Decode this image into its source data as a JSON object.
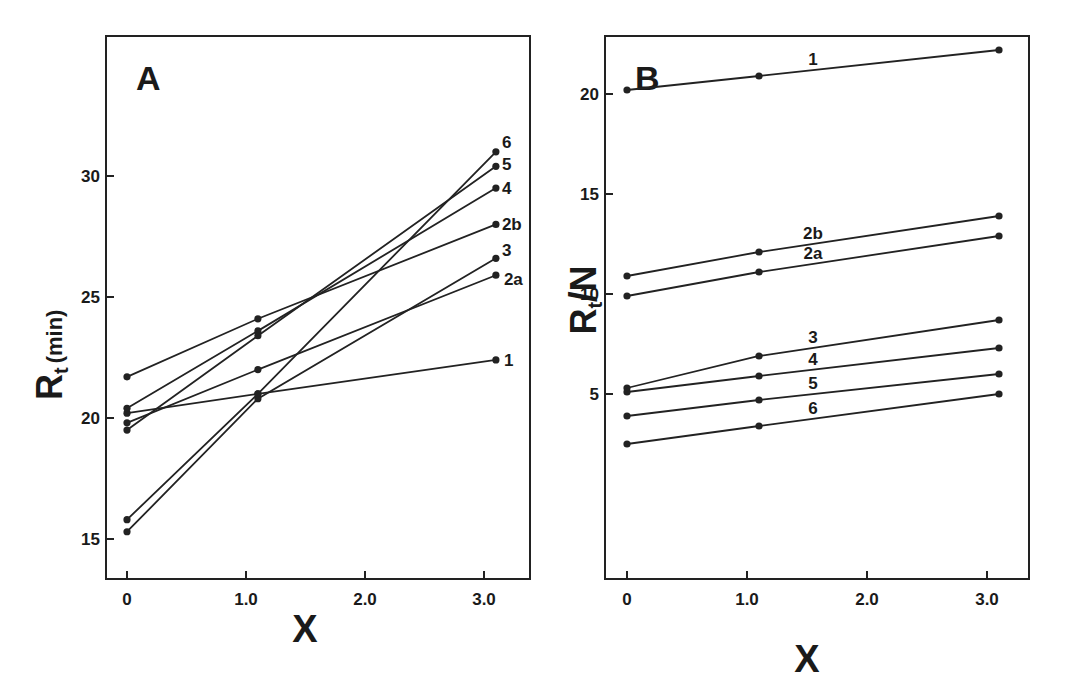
{
  "chart_data": [
    {
      "panel": "A",
      "type": "line",
      "title": "A",
      "xlabel": "X",
      "ylabel": "Rt (min)",
      "ylabel_main": "R",
      "ylabel_sub": "t",
      "ylabel_unit": "(min)",
      "xlim": [
        -0.2,
        3.4
      ],
      "ylim": [
        13,
        35
      ],
      "xticks": [
        0,
        1.0,
        2.0,
        3.0
      ],
      "xtick_labels": [
        "0",
        "1.0",
        "2.0",
        "3.0"
      ],
      "yticks": [
        15,
        20,
        25,
        30
      ],
      "ytick_labels": [
        "15",
        "20",
        "25",
        "30"
      ],
      "grid": false,
      "x": [
        0,
        1.1,
        3.1
      ],
      "series": [
        {
          "name": "1",
          "values": [
            20.2,
            21.0,
            22.4
          ]
        },
        {
          "name": "2a",
          "values": [
            19.8,
            22.0,
            25.9
          ]
        },
        {
          "name": "2b",
          "values": [
            21.7,
            24.1,
            28.0
          ]
        },
        {
          "name": "3",
          "values": [
            15.3,
            20.8,
            26.6
          ]
        },
        {
          "name": "4",
          "values": [
            20.4,
            23.6,
            29.5
          ]
        },
        {
          "name": "5",
          "values": [
            19.5,
            23.4,
            30.4
          ]
        },
        {
          "name": "6",
          "values": [
            15.8,
            21.0,
            31.0
          ]
        }
      ]
    },
    {
      "panel": "B",
      "type": "line",
      "title": "B",
      "xlabel": "X",
      "ylabel": "Rt/N",
      "ylabel_main": "R",
      "ylabel_sub": "t",
      "ylabel_denom": "N",
      "xlim": [
        -0.2,
        3.4
      ],
      "ylim": [
        0,
        22.8
      ],
      "xticks": [
        0,
        1.0,
        2.0,
        3.0
      ],
      "xtick_labels": [
        "0",
        "1.0",
        "2.0",
        "3.0"
      ],
      "yticks": [
        5,
        10,
        15,
        20
      ],
      "ytick_labels": [
        "5",
        "10",
        "15",
        "20"
      ],
      "grid": false,
      "x": [
        0,
        1.1,
        3.1
      ],
      "series": [
        {
          "name": "1",
          "values": [
            20.2,
            20.9,
            22.2
          ]
        },
        {
          "name": "2b",
          "values": [
            10.9,
            12.1,
            13.9
          ]
        },
        {
          "name": "2a",
          "values": [
            9.9,
            11.1,
            12.9
          ]
        },
        {
          "name": "3",
          "values": [
            5.3,
            6.9,
            8.7
          ]
        },
        {
          "name": "4",
          "values": [
            5.1,
            5.9,
            7.3
          ]
        },
        {
          "name": "5",
          "values": [
            3.9,
            4.7,
            6.0
          ]
        },
        {
          "name": "6",
          "values": [
            2.5,
            3.4,
            5.0
          ]
        }
      ]
    }
  ],
  "labels": {
    "panelA": "A",
    "panelB": "B",
    "xAxisA": "X",
    "xAxisB": "X",
    "yAxisA_main": "R",
    "yAxisA_sub": "t",
    "yAxisA_unit": "(min)",
    "yAxisB_main": "R",
    "yAxisB_sub": "t",
    "yAxisB_denom": "N"
  }
}
